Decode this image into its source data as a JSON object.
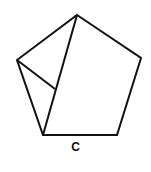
{
  "figure": {
    "label": "C",
    "stroke_color": "#111111",
    "pentagon_vertices": [
      [
        77,
        15
      ],
      [
        141,
        58
      ],
      [
        117,
        135
      ],
      [
        43,
        135
      ],
      [
        17,
        60
      ]
    ],
    "inner_lines": [
      {
        "from": [
          77,
          15
        ],
        "to": [
          43,
          135
        ]
      },
      {
        "from": [
          17,
          60
        ],
        "to": [
          55,
          89
        ]
      }
    ]
  }
}
